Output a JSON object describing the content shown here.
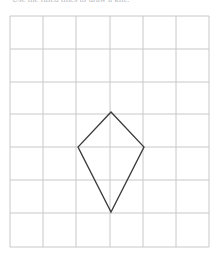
{
  "page": {
    "background_color": "#ffffff",
    "width": 217,
    "height": 259
  },
  "header": {
    "instruction_text": "Use the ruled lines to draw a kite.",
    "text_color": "#b9b9bd",
    "clipped": "true"
  },
  "grid": {
    "columns": 6,
    "rows": 7,
    "line_color": "#c8c8c8",
    "border_color": "#c8c8c8",
    "cell_size_px": 33,
    "origin_x": 10,
    "origin_y": 16,
    "x_lines": [
      10,
      43,
      76,
      110,
      143,
      176,
      209
    ],
    "y_lines": [
      16,
      49,
      82,
      114,
      147,
      180,
      213,
      247
    ]
  },
  "shape": {
    "name": "kite",
    "stroke_color": "#3a3a3a",
    "fill": "none",
    "stroke_width": 1.3,
    "vertices_px": [
      {
        "label": "top",
        "x": 111,
        "y": 112
      },
      {
        "label": "right",
        "x": 144,
        "y": 147
      },
      {
        "label": "bottom",
        "x": 111,
        "y": 212
      },
      {
        "label": "left",
        "x": 78,
        "y": 147
      }
    ],
    "vertices_grid": [
      {
        "label": "top",
        "col": 3,
        "row": 3
      },
      {
        "label": "right",
        "col": 4,
        "row": 4
      },
      {
        "label": "bottom",
        "col": 3,
        "row": 6
      },
      {
        "label": "left",
        "col": 2,
        "row": 4
      }
    ],
    "points_attr": "111,112 144,147 111,212 78,147"
  }
}
